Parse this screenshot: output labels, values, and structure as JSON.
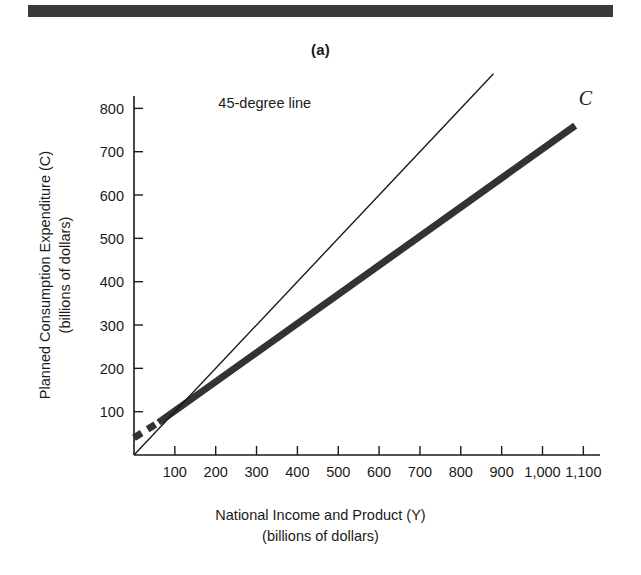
{
  "figure": {
    "panel_label": "(a)",
    "top_rule_color": "#3a3a3a"
  },
  "axes": {
    "y_title_line1": "Planned Consumption Expenditure (C)",
    "y_title_line2": "(billions of dollars)",
    "x_title_line1": "National Income and Product (Y)",
    "x_title_line2": "(billions of dollars)"
  },
  "chart_data": {
    "type": "line",
    "title": "(a)",
    "xlabel": "National Income and Product (Y) (billions of dollars)",
    "ylabel": "Planned Consumption Expenditure (C) (billions of dollars)",
    "xlim": [
      0,
      1150
    ],
    "ylim": [
      0,
      880
    ],
    "xticks": [
      100,
      200,
      300,
      400,
      500,
      600,
      700,
      800,
      900,
      1000,
      1100
    ],
    "xticklabels": [
      "100",
      "200",
      "300",
      "400",
      "500",
      "600",
      "700",
      "800",
      "900",
      "1,000",
      "1,100"
    ],
    "yticks": [
      100,
      200,
      300,
      400,
      500,
      600,
      700,
      800
    ],
    "yticklabels": [
      "100",
      "200",
      "300",
      "400",
      "500",
      "600",
      "700",
      "800"
    ],
    "grid": false,
    "legend": "none",
    "series": [
      {
        "name": "C",
        "label": "C",
        "style": "thick-solid-with-dashed-start",
        "color": "#333333",
        "linewidth": 7,
        "x": [
          0,
          60,
          1080
        ],
        "values": [
          40,
          75,
          760
        ],
        "dashed_x": [
          0,
          60
        ],
        "dashed_values": [
          40,
          75
        ],
        "intercept": 40,
        "slope": 0.667
      },
      {
        "name": "45-degree line",
        "label": "45-degree line",
        "style": "thin-solid",
        "color": "#1a1a1a",
        "linewidth": 1.4,
        "x": [
          0,
          880
        ],
        "values": [
          0,
          880
        ],
        "slope": 1
      }
    ],
    "annotations": [
      {
        "text": "45-degree line",
        "x": 320,
        "y": 800
      },
      {
        "text": "C",
        "x": 1105,
        "y": 808
      }
    ]
  }
}
